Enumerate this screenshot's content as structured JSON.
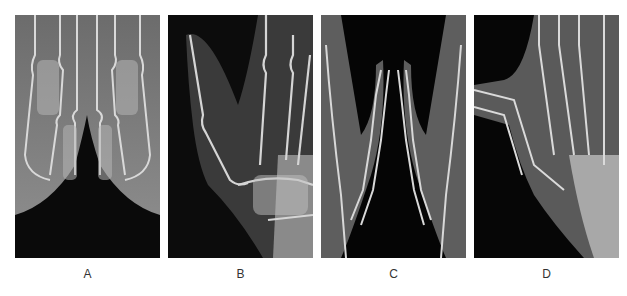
{
  "figure": {
    "panels": [
      {
        "id": "A",
        "label": "A",
        "description": "X-ray: bilateral metacarpophalangeal region, hands side by side"
      },
      {
        "id": "B",
        "label": "B",
        "description": "X-ray: oblique view of hand and wrist with thumb"
      },
      {
        "id": "C",
        "label": "C",
        "description": "X-ray: bilateral thumbs, tips pointing together"
      },
      {
        "id": "D",
        "label": "D",
        "description": "X-ray: hand with thumb and carpal region"
      }
    ],
    "colors": {
      "background": "#ffffff",
      "xray_dark": "#050505",
      "bone": "#d8d8d8",
      "soft_tissue": "#6a6a6a",
      "label_text": "#333333"
    }
  }
}
